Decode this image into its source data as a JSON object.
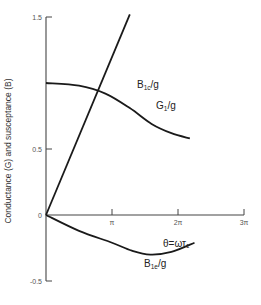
{
  "chart_data": {
    "type": "line",
    "title": "",
    "xlabel": "",
    "ylabel": "Conductance (G) and susceptance (B)",
    "xlim": [
      0,
      3.2
    ],
    "ylim": [
      -0.5,
      1.5
    ],
    "x_unit": "pi",
    "x_ticks": [
      {
        "value": 1,
        "label": "π"
      },
      {
        "value": 2,
        "label": "2π"
      },
      {
        "value": 3,
        "label": "3π"
      }
    ],
    "y_ticks": [
      {
        "value": 1.5,
        "label": "1.5"
      },
      {
        "value": 0.5,
        "label": "0.5"
      },
      {
        "value": 0,
        "label": "0"
      },
      {
        "value": -0.5,
        "label": "-0.5"
      }
    ],
    "grid": false,
    "annotations": [
      {
        "text": "θ=ωτ₁",
        "x": 2.0,
        "y": -0.2
      }
    ],
    "series": [
      {
        "name": "B1c/g",
        "label_main": "B",
        "label_sub": "1c",
        "label_tail": "/g",
        "x": [
          0,
          0.5,
          1.0,
          1.27
        ],
        "y": [
          0,
          0.6,
          1.19,
          1.52
        ]
      },
      {
        "name": "G1/g",
        "label_main": "G",
        "label_sub": "1",
        "label_tail": "/g",
        "x": [
          0,
          0.5,
          0.9,
          1.27,
          1.6,
          1.9,
          2.18
        ],
        "y": [
          1.0,
          0.98,
          0.92,
          0.81,
          0.69,
          0.62,
          0.58
        ]
      },
      {
        "name": "B1e/g",
        "label_main": "B",
        "label_sub": "1e",
        "label_tail": "/g",
        "x": [
          0,
          0.5,
          1.0,
          1.3,
          1.58,
          1.9,
          2.25
        ],
        "y": [
          0,
          -0.12,
          -0.21,
          -0.27,
          -0.3,
          -0.28,
          -0.21
        ]
      }
    ]
  }
}
